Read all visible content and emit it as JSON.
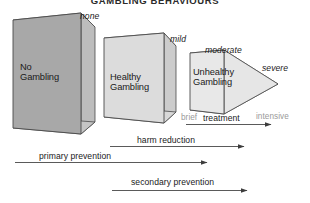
{
  "figure": {
    "title": "GAMBLING BEHAVIOURS",
    "blocks": [
      {
        "id": "no-gambling",
        "line1": "No",
        "line2": "Gambling",
        "fill": "#a8a8a8"
      },
      {
        "id": "healthy-gambling",
        "line1": "Healthy",
        "line2": "Gambling",
        "fill": "#dcdcdc"
      },
      {
        "id": "unhealthy-gambling",
        "line1": "Unhealthy",
        "line2": "Gambling",
        "fill": "#e8e8e8"
      }
    ],
    "severity_labels": [
      {
        "id": "none",
        "text": "none"
      },
      {
        "id": "mild",
        "text": "mild"
      },
      {
        "id": "moderate",
        "text": "moderate"
      },
      {
        "id": "severe",
        "text": "severe"
      }
    ],
    "intensity_labels": [
      {
        "id": "brief",
        "text": "brief"
      },
      {
        "id": "intensive",
        "text": "intensive"
      }
    ],
    "arrows": [
      {
        "id": "treatment",
        "text": "treatment"
      },
      {
        "id": "harm-reduction",
        "text": "harm reduction"
      },
      {
        "id": "primary-prevention",
        "text": "primary prevention"
      },
      {
        "id": "secondary-prevention",
        "text": "secondary prevention"
      }
    ],
    "colors": {
      "stroke": "#4a4a4a",
      "text": "#1a1a1a",
      "muted_text": "#9a9a9a",
      "block_dark": "#a8a8a8",
      "block_mid": "#dcdcdc",
      "block_light": "#e8e8e8",
      "side_dark": "#8f8f8f",
      "side_light": "#cfcfcf"
    }
  }
}
